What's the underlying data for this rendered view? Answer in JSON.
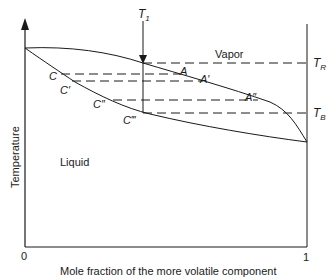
{
  "diagram": {
    "type": "phase-diagram",
    "title": "",
    "x_axis": {
      "label": "Mole fraction of the more volatile component",
      "ticks": [
        "0",
        "1"
      ]
    },
    "y_axis": {
      "label": "Temperature"
    },
    "regions": {
      "vapor": "Vapor",
      "liquid": "Liquid"
    },
    "temperatures": {
      "t1": "T",
      "t1_sub": "1",
      "tr": "T",
      "tr_sub": "R",
      "tb": "T",
      "tb_sub": "B"
    },
    "points": {
      "c": "C",
      "c1": "C′",
      "c2": "C″",
      "c3": "C‴",
      "a": "A",
      "a1": "A′",
      "a2": "A″"
    },
    "colors": {
      "line": "#1a1a1a",
      "background": "#ffffff"
    }
  }
}
